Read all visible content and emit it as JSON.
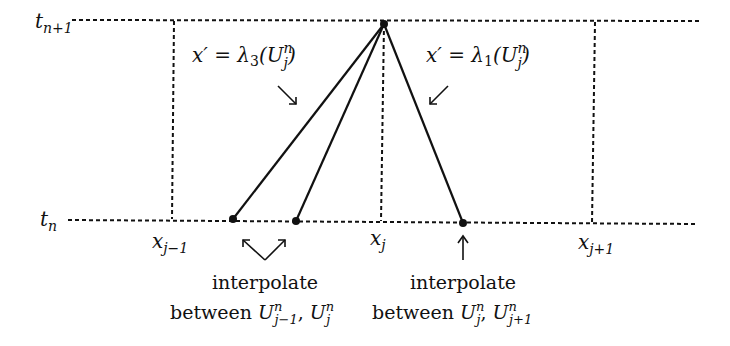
{
  "diagram": {
    "time_levels": {
      "top": {
        "base": "t",
        "sub": "n+1"
      },
      "bottom": {
        "base": "t",
        "sub": "n"
      }
    },
    "grid_points": [
      {
        "base": "x",
        "sub": "j−1"
      },
      {
        "base": "x",
        "sub": "j"
      },
      {
        "base": "x",
        "sub": "j+1"
      }
    ],
    "characteristics": {
      "left": {
        "lhs": "x′ = λ",
        "index": "3",
        "arg_open": "(U",
        "sup": "n",
        "sub": "j",
        "arg_close": ")"
      },
      "right": {
        "lhs": "x′ = λ",
        "index": "1",
        "arg_open": "(U",
        "sup": "n",
        "sub": "j",
        "arg_close": ")"
      }
    },
    "annotations": {
      "left": {
        "line1": "interpolate",
        "line2_prefix": "between ",
        "u1": "U",
        "u1_sup": "n",
        "u1_sub": "j−1",
        "sep": ", ",
        "u2": "U",
        "u2_sup": "n",
        "u2_sub": "j"
      },
      "right": {
        "line1": "interpolate",
        "line2_prefix": "between ",
        "u1": "U",
        "u1_sup": "n",
        "u1_sub": "j",
        "sep": ", ",
        "u2": "U",
        "u2_sup": "n",
        "u2_sub": "j+1"
      }
    },
    "colors": {
      "ink": "#111111",
      "background": "#ffffff"
    }
  }
}
